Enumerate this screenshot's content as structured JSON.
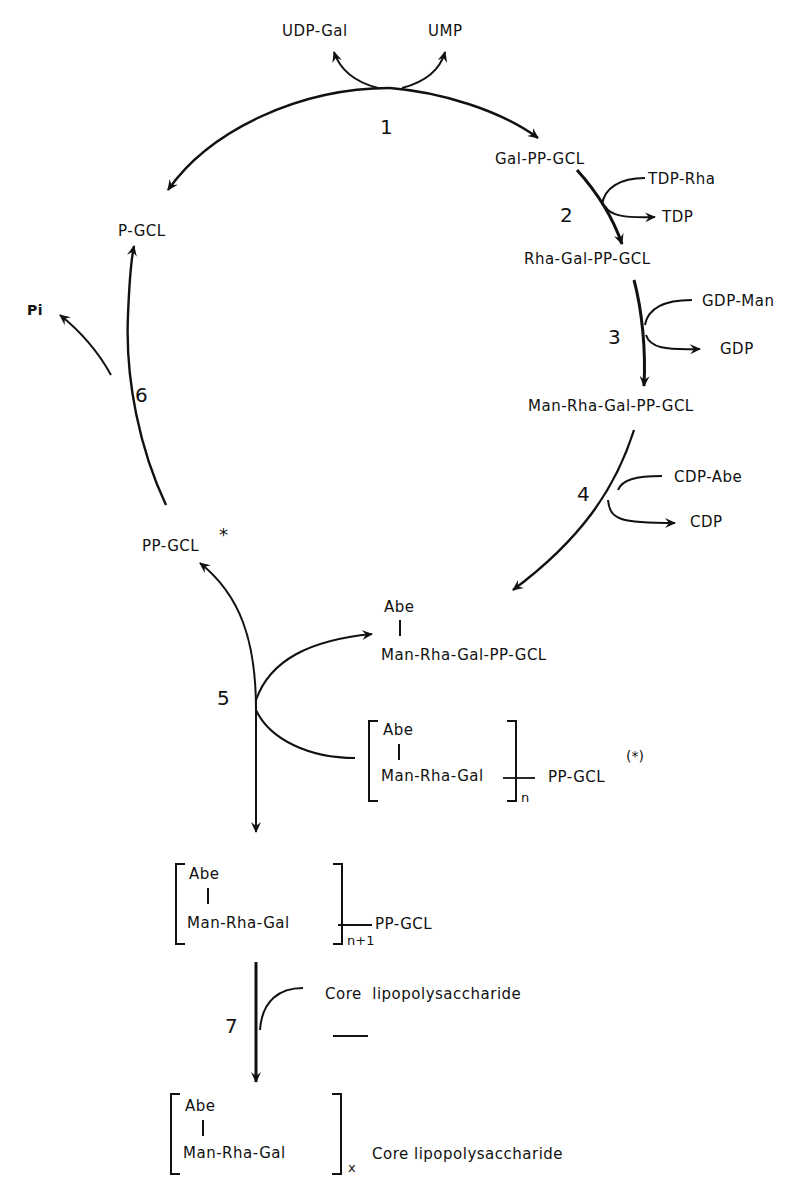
{
  "diagram": {
    "type": "metabolic-cycle",
    "nodes": {
      "udp_gal": "UDP-Gal",
      "ump": "UMP",
      "gal_pp_gcl": "Gal-PP-GCL",
      "tdp_rha": "TDP-Rha",
      "tdp": "TDP",
      "rha_gal_pp_gcl": "Rha-Gal-PP-GCL",
      "gdp_man": "GDP-Man",
      "gdp": "GDP",
      "man_rha_gal_pp_gcl": "Man-Rha-Gal-PP-GCL",
      "cdp_abe": "CDP-Abe",
      "cdp": "CDP",
      "abe_top": "Abe",
      "abe_man_rha_gal_pp_gcl": "Man-Rha-Gal-PP-GCL",
      "pp_gcl_star": "PP-GCL",
      "pp_gcl_star_mark": "*",
      "p_gcl": "P-GCL",
      "pi": "Pi",
      "polymer_n_abe": "Abe",
      "polymer_n_chain": "Man-Rha-Gal",
      "polymer_n_sub": "n",
      "polymer_n_tail": "PP-GCL",
      "polymer_n_mark": "(*)",
      "polymer_n1_abe": "Abe",
      "polymer_n1_chain": "Man-Rha-Gal",
      "polymer_n1_sub": "n+1",
      "polymer_n1_tail": "PP-GCL",
      "core_lps": "Core  lipopolysaccharide",
      "final_abe": "Abe",
      "final_chain": "Man-Rha-Gal",
      "final_sub": "x",
      "final_tail": "Core lipopolysaccharide"
    },
    "steps": [
      "1",
      "2",
      "3",
      "4",
      "5",
      "6",
      "7"
    ]
  }
}
